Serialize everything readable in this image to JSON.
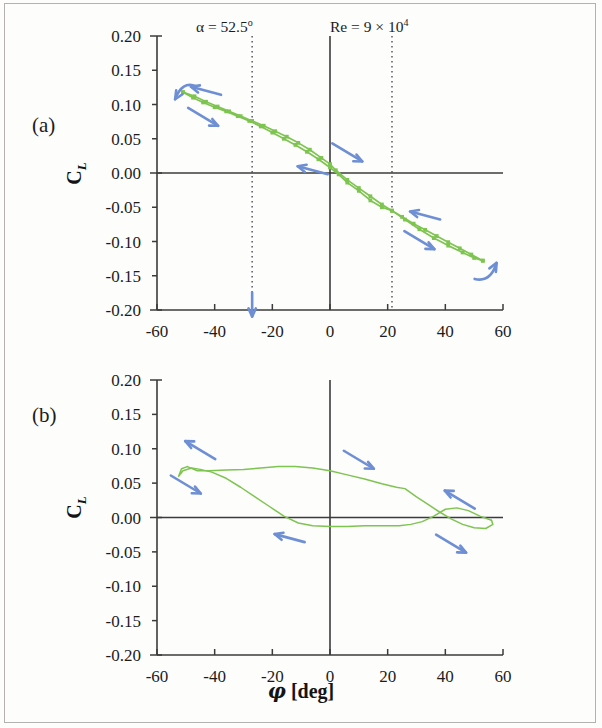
{
  "figure": {
    "panel_a_label": "(a)",
    "panel_b_label": "(b)",
    "annotation_alpha": "α = 52.5",
    "annotation_alpha_sup": "o",
    "annotation_re_prefix": "Re = 9 × 10",
    "annotation_re_sup": "4",
    "y_axis_title_main": "C",
    "y_axis_title_sub": "L",
    "x_axis_title_symbol": "φ",
    "x_axis_title_units": " [deg]",
    "curve_color": "#7ec450",
    "arrow_color": "#6e8fd4",
    "axis_color": "#3b3b3b",
    "text_color": "#1c1c1c"
  },
  "chart_data": [
    {
      "type": "line",
      "panel": "(a)",
      "title": "",
      "subtitle": "alpha = 52.5 deg, Re = 9 x 10^4",
      "xlabel": "φ [deg]",
      "ylabel": "C_L",
      "xlim": [
        -60,
        60
      ],
      "ylim": [
        -0.2,
        0.2
      ],
      "xticks": [
        -60,
        -40,
        -20,
        0,
        20,
        40,
        60
      ],
      "yticks": [
        0.2,
        0.15,
        0.1,
        0.05,
        0.0,
        -0.05,
        -0.1,
        -0.15,
        -0.2
      ],
      "xtick_labels": [
        "-60",
        "-40",
        "-20",
        "0",
        "20",
        "40",
        "60"
      ],
      "ytick_labels": [
        "0.20",
        "0.15",
        "0.10",
        "0.05",
        "0.00",
        "-0.05",
        "-0.10",
        "-0.15",
        "-0.20"
      ],
      "grid": false,
      "legend": null,
      "markers": true,
      "annotations": [
        {
          "text": "α = 52.5°",
          "x": -27,
          "y": 0.225
        },
        {
          "text": "Re = 9 × 10⁴",
          "x": 21.5,
          "y": 0.225
        }
      ],
      "reference_lines": [
        {
          "orientation": "vertical",
          "x": -27,
          "style": "dotted"
        },
        {
          "orientation": "vertical",
          "x": 21.5,
          "style": "dotted"
        },
        {
          "orientation": "vertical",
          "x": 0,
          "style": "solid"
        },
        {
          "orientation": "horizontal",
          "y": 0.0,
          "style": "solid"
        }
      ],
      "series": [
        {
          "name": "upstroke (phi increasing)",
          "points": [
            [
              -51.0,
              0.118
            ],
            [
              -47.5,
              0.11
            ],
            [
              -44.0,
              0.103
            ],
            [
              -40.0,
              0.096
            ],
            [
              -36.0,
              0.09
            ],
            [
              -32.0,
              0.083
            ],
            [
              -28.0,
              0.076
            ],
            [
              -24.0,
              0.068
            ],
            [
              -20.0,
              0.059
            ],
            [
              -16.0,
              0.05
            ],
            [
              -12.0,
              0.041
            ],
            [
              -8.0,
              0.031
            ],
            [
              -4.0,
              0.02
            ],
            [
              0.0,
              0.008
            ],
            [
              3.0,
              -0.002
            ],
            [
              6.0,
              -0.014
            ],
            [
              10.0,
              -0.026
            ],
            [
              14.0,
              -0.04
            ],
            [
              18.0,
              -0.05
            ],
            [
              21.5,
              -0.055
            ],
            [
              26.0,
              -0.068
            ],
            [
              31.0,
              -0.082
            ],
            [
              36.0,
              -0.095
            ],
            [
              41.0,
              -0.106
            ],
            [
              46.0,
              -0.116
            ],
            [
              50.0,
              -0.124
            ],
            [
              53.0,
              -0.128
            ]
          ]
        },
        {
          "name": "downstroke (phi decreasing)",
          "points": [
            [
              53.0,
              -0.128
            ],
            [
              49.0,
              -0.119
            ],
            [
              45.0,
              -0.11
            ],
            [
              41.0,
              -0.101
            ],
            [
              37.0,
              -0.092
            ],
            [
              33.0,
              -0.083
            ],
            [
              29.0,
              -0.074
            ],
            [
              25.0,
              -0.064
            ],
            [
              21.5,
              -0.055
            ],
            [
              18.0,
              -0.046
            ],
            [
              14.0,
              -0.034
            ],
            [
              10.0,
              -0.022
            ],
            [
              6.0,
              -0.01
            ],
            [
              2.0,
              0.004
            ],
            [
              0.0,
              0.013
            ],
            [
              -3.0,
              0.022
            ],
            [
              -7.0,
              0.034
            ],
            [
              -11.0,
              0.044
            ],
            [
              -15.0,
              0.053
            ],
            [
              -19.0,
              0.061
            ],
            [
              -23.0,
              0.069
            ],
            [
              -27.0,
              0.076
            ],
            [
              -31.0,
              0.083
            ],
            [
              -35.0,
              0.09
            ],
            [
              -39.0,
              0.097
            ],
            [
              -43.0,
              0.104
            ],
            [
              -47.0,
              0.112
            ],
            [
              -51.0,
              0.118
            ]
          ]
        }
      ],
      "direction_arrows": [
        {
          "x": -43,
          "y": 0.12,
          "dir": "left"
        },
        {
          "x": -44,
          "y": 0.082,
          "dir": "right-down"
        },
        {
          "x": -52,
          "y": 0.112,
          "dir": "curl-left"
        },
        {
          "x": 6,
          "y": 0.03,
          "dir": "right-down"
        },
        {
          "x": -6,
          "y": 0.004,
          "dir": "left"
        },
        {
          "x": 33,
          "y": -0.062,
          "dir": "left"
        },
        {
          "x": 31,
          "y": -0.098,
          "dir": "right-down"
        },
        {
          "x": 55,
          "y": -0.14,
          "dir": "curl-up"
        },
        {
          "x": -27,
          "y": -0.195,
          "dir": "down"
        }
      ]
    },
    {
      "type": "line",
      "panel": "(b)",
      "title": "",
      "xlabel": "φ [deg]",
      "ylabel": "C_L",
      "xlim": [
        -60,
        60
      ],
      "ylim": [
        -0.2,
        0.2
      ],
      "xticks": [
        -60,
        -40,
        -20,
        0,
        20,
        40,
        60
      ],
      "yticks": [
        0.2,
        0.15,
        0.1,
        0.05,
        0.0,
        -0.05,
        -0.1,
        -0.15,
        -0.2
      ],
      "xtick_labels": [
        "-60",
        "-40",
        "-20",
        "0",
        "20",
        "40",
        "60"
      ],
      "ytick_labels": [
        "0.20",
        "0.15",
        "0.10",
        "0.05",
        "0.00",
        "-0.05",
        "-0.10",
        "-0.15",
        "-0.20"
      ],
      "grid": false,
      "legend": null,
      "markers": false,
      "reference_lines": [
        {
          "orientation": "vertical",
          "x": 0,
          "style": "solid"
        },
        {
          "orientation": "horizontal",
          "y": 0.0,
          "style": "solid"
        }
      ],
      "series": [
        {
          "name": "upper branch (phi decreasing)",
          "points": [
            [
              56.0,
              -0.004
            ],
            [
              52.0,
              0.002
            ],
            [
              48.0,
              0.01
            ],
            [
              44.0,
              0.014
            ],
            [
              40.0,
              0.012
            ],
            [
              36.0,
              0.002
            ],
            [
              32.0,
              -0.006
            ],
            [
              28.0,
              -0.01
            ],
            [
              24.0,
              -0.012
            ],
            [
              18.0,
              -0.012
            ],
            [
              12.0,
              -0.012
            ],
            [
              6.0,
              -0.013
            ],
            [
              0.0,
              -0.013
            ],
            [
              -6.0,
              -0.012
            ],
            [
              -11.0,
              -0.008
            ],
            [
              -16.0,
              0.002
            ],
            [
              -21.0,
              0.016
            ],
            [
              -26.0,
              0.03
            ],
            [
              -31.0,
              0.044
            ],
            [
              -36.0,
              0.057
            ],
            [
              -41.0,
              0.066
            ],
            [
              -45.0,
              0.07
            ],
            [
              -48.0,
              0.072
            ],
            [
              -51.0,
              0.068
            ],
            [
              -52.5,
              0.06
            ],
            [
              -51.5,
              0.071
            ],
            [
              -49.5,
              0.074
            ]
          ]
        },
        {
          "name": "lower branch (phi increasing)",
          "points": [
            [
              -49.5,
              0.074
            ],
            [
              -46.0,
              0.068
            ],
            [
              -42.0,
              0.068
            ],
            [
              -36.0,
              0.069
            ],
            [
              -30.0,
              0.07
            ],
            [
              -24.0,
              0.072
            ],
            [
              -18.0,
              0.074
            ],
            [
              -12.0,
              0.074
            ],
            [
              -6.0,
              0.072
            ],
            [
              0.0,
              0.068
            ],
            [
              6.0,
              0.062
            ],
            [
              12.0,
              0.056
            ],
            [
              18.0,
              0.049
            ],
            [
              23.0,
              0.044
            ],
            [
              26.0,
              0.042
            ],
            [
              30.0,
              0.03
            ],
            [
              34.0,
              0.019
            ],
            [
              38.0,
              0.008
            ],
            [
              42.0,
              -0.002
            ],
            [
              46.0,
              -0.01
            ],
            [
              50.0,
              -0.015
            ],
            [
              54.0,
              -0.016
            ],
            [
              56.5,
              -0.01
            ],
            [
              56.0,
              -0.004
            ]
          ]
        }
      ],
      "direction_arrows": [
        {
          "x": -45,
          "y": 0.098,
          "dir": "left-up"
        },
        {
          "x": -50,
          "y": 0.048,
          "dir": "right-down"
        },
        {
          "x": 10,
          "y": 0.084,
          "dir": "right-down"
        },
        {
          "x": -14,
          "y": -0.03,
          "dir": "left"
        },
        {
          "x": 45,
          "y": 0.026,
          "dir": "left-up"
        },
        {
          "x": 42,
          "y": -0.038,
          "dir": "right-down"
        }
      ]
    }
  ]
}
